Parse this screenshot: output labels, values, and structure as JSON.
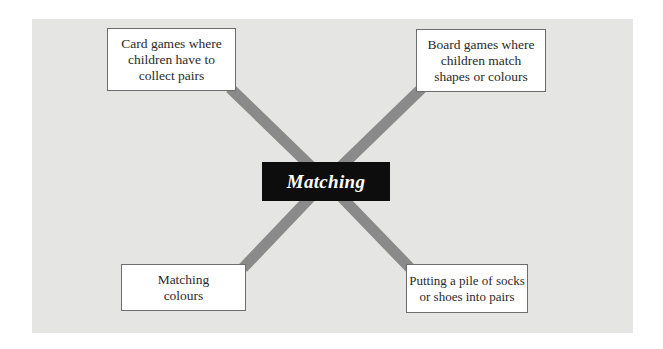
{
  "diagram": {
    "type": "mind-map",
    "colors": {
      "panel_background": "#e5e5e4",
      "connector": "#8a8a8a",
      "center_background": "#0d0d0d",
      "center_text": "#ffffff",
      "node_background": "#ffffff",
      "node_border": "#6d6d6d"
    },
    "center": {
      "label": "Matching"
    },
    "nodes": [
      {
        "position": "top-left",
        "label": "Card games where\nchildren have to\ncollect pairs"
      },
      {
        "position": "top-right",
        "label": "Board games where\nchildren match\nshapes or colours"
      },
      {
        "position": "bottom-left",
        "label": "Matching\ncolours"
      },
      {
        "position": "bottom-right",
        "label": "Putting a pile of socks\nor shoes into pairs"
      }
    ]
  }
}
